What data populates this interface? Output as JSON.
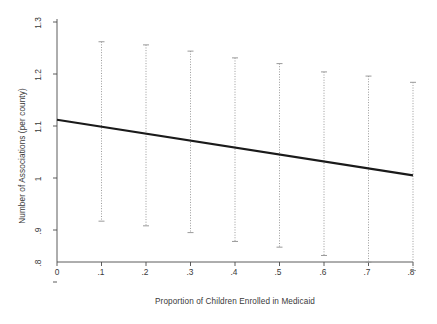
{
  "chart_data": {
    "type": "line",
    "title": "",
    "subtitle": "",
    "xlabel": "Proportion of Children Enrolled in Medicaid",
    "ylabel": "Number of Associations (per county)",
    "xlim": [
      0,
      0.8
    ],
    "ylim": [
      0.8,
      1.3
    ],
    "xticks": [
      0,
      0.1,
      0.2,
      0.3,
      0.4,
      0.5,
      0.6,
      0.7,
      0.8
    ],
    "xticklabels": [
      "0",
      ".1",
      ".2",
      ".3",
      ".4",
      ".5",
      ".6",
      ".7",
      ".8"
    ],
    "yticks": [
      0.8,
      0.9,
      1.0,
      1.1,
      1.2,
      1.3
    ],
    "yticklabels": [
      ".8",
      ".9",
      "1",
      "1.1",
      "1.2",
      "1.3"
    ],
    "grid": false,
    "legend": "none",
    "series": [
      {
        "name": "Predicted number of associations",
        "style": "solid-line",
        "color": "#1a1a1a",
        "x": [
          0,
          0.8
        ],
        "values": [
          1.112,
          1.005
        ]
      },
      {
        "name": "95% confidence interval",
        "style": "dotted-error-bars",
        "color": "#9a9a9a",
        "x": [
          0.1,
          0.2,
          0.3,
          0.4,
          0.5,
          0.6,
          0.7,
          0.8
        ],
        "point_estimates": [
          1.099,
          1.086,
          1.072,
          1.059,
          1.045,
          1.032,
          1.018,
          1.005
        ],
        "lower": [
          0.917,
          0.908,
          0.895,
          0.878,
          0.867,
          0.851,
          0.838,
          0.822
        ],
        "upper": [
          1.262,
          1.256,
          1.244,
          1.231,
          1.22,
          1.204,
          1.196,
          1.184
        ]
      }
    ]
  },
  "axes": {
    "x_axis_name": "x-axis",
    "y_axis_name": "y-axis"
  }
}
